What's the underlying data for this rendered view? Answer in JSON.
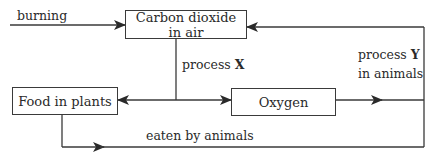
{
  "diagram": {
    "nodes": {
      "co2": {
        "line1": "Carbon dioxide",
        "line2": "in air"
      },
      "food": {
        "label": "Food in plants"
      },
      "oxygen": {
        "label": "Oxygen"
      }
    },
    "edges": {
      "burning": {
        "label": "burning"
      },
      "process_x": {
        "prefix": "process ",
        "key": "X"
      },
      "process_y": {
        "prefix": "process ",
        "key": "Y",
        "line2": "in animals"
      },
      "eaten": {
        "label": "eaten by animals"
      }
    }
  }
}
